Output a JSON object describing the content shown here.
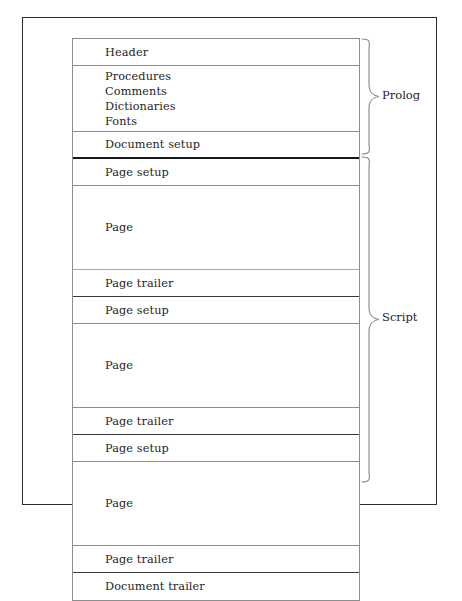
{
  "figure": {
    "name": "postscript-document-structure",
    "frame_color": "#2b2b2b",
    "rule_color": "#8d8d8d",
    "heavy_rule_color": "#17181a",
    "text_color": "#1e1e1e"
  },
  "structure": {
    "rows": [
      {
        "id": "header",
        "label": "Header",
        "kind": "single",
        "rule": "thin"
      },
      {
        "id": "resources",
        "label": "",
        "kind": "list",
        "rule": "thin",
        "lines": [
          "Procedures",
          "Comments",
          "Dictionaries",
          "Fonts"
        ]
      },
      {
        "id": "document-setup",
        "label": "Document setup",
        "kind": "single",
        "rule": "heavy"
      },
      {
        "id": "page-setup-1",
        "label": "Page setup",
        "kind": "single",
        "rule": "thin"
      },
      {
        "id": "page-1",
        "label": "Page",
        "kind": "page",
        "rule": "faint"
      },
      {
        "id": "page-trailer-1",
        "label": "Page trailer",
        "kind": "single",
        "rule": "med"
      },
      {
        "id": "page-setup-2",
        "label": "Page setup",
        "kind": "single",
        "rule": "thin"
      },
      {
        "id": "page-2",
        "label": "Page",
        "kind": "page",
        "rule": "thin"
      },
      {
        "id": "page-trailer-2",
        "label": "Page trailer",
        "kind": "single",
        "rule": "med"
      },
      {
        "id": "page-setup-3",
        "label": "Page setup",
        "kind": "single",
        "rule": "thin"
      },
      {
        "id": "page-3",
        "label": "Page",
        "kind": "page",
        "rule": "thin"
      },
      {
        "id": "page-trailer-3",
        "label": "Page trailer",
        "kind": "single",
        "rule": "med"
      },
      {
        "id": "document-trailer",
        "label": "Document trailer",
        "kind": "single",
        "rule": "none"
      }
    ]
  },
  "braces": {
    "prolog": {
      "label": "Prolog",
      "spans": [
        "header",
        "resources",
        "document-setup"
      ]
    },
    "script": {
      "label": "Script",
      "spans": [
        "page-setup-1",
        "page-1",
        "page-trailer-1",
        "page-setup-2",
        "page-2",
        "page-trailer-2",
        "page-setup-3",
        "page-3",
        "page-trailer-3",
        "document-trailer"
      ]
    }
  }
}
